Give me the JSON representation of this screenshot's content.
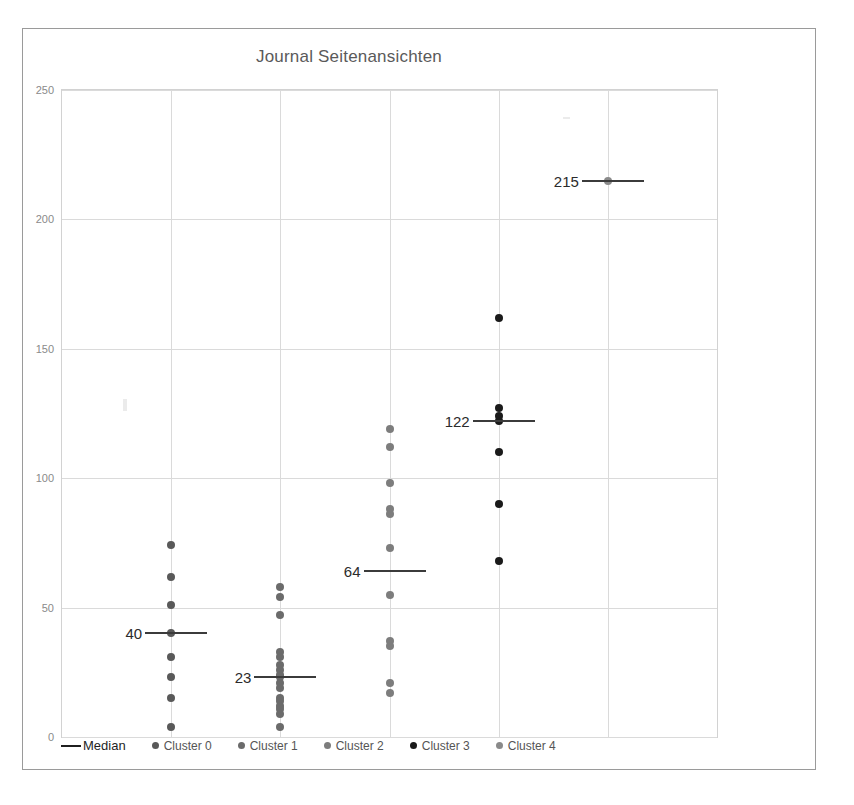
{
  "chart_data": {
    "type": "scatter",
    "title": "Journal Seitenansichten",
    "xlabel": "",
    "ylabel": "",
    "ylim": [
      0,
      250
    ],
    "yticks": [
      0,
      50,
      100,
      150,
      200,
      250
    ],
    "grid": true,
    "legend_position": "bottom",
    "legend": [
      {
        "label": "Median",
        "marker": "line",
        "color": "#1f1f1f"
      },
      {
        "label": "Cluster 0",
        "marker": "dot",
        "color": "#595959"
      },
      {
        "label": "Cluster 1",
        "marker": "dot",
        "color": "#6b6b6b"
      },
      {
        "label": "Cluster 2",
        "marker": "dot",
        "color": "#7d7d7d"
      },
      {
        "label": "Cluster 3",
        "marker": "dot",
        "color": "#1a1a1a"
      },
      {
        "label": "Cluster 4",
        "marker": "dot",
        "color": "#8a8a8a"
      }
    ],
    "series": [
      {
        "name": "Cluster 0",
        "color": "#595959",
        "x_slot": 1,
        "median": 40,
        "median_label": "40",
        "values": [
          74,
          62,
          51,
          40,
          31,
          23,
          15,
          4
        ]
      },
      {
        "name": "Cluster 1",
        "color": "#6b6b6b",
        "x_slot": 2,
        "median": 23,
        "median_label": "23",
        "values": [
          58,
          54,
          47,
          33,
          31,
          28,
          26,
          24,
          23,
          21,
          19,
          15,
          14,
          12,
          11,
          9,
          4
        ]
      },
      {
        "name": "Cluster 2",
        "color": "#7d7d7d",
        "x_slot": 3,
        "median": 64,
        "median_label": "64",
        "values": [
          119,
          112,
          98,
          88,
          86,
          73,
          55,
          37,
          35,
          21,
          17
        ]
      },
      {
        "name": "Cluster 3",
        "color": "#1a1a1a",
        "x_slot": 4,
        "median": 122,
        "median_label": "122",
        "values": [
          162,
          127,
          124,
          122,
          110,
          90,
          68
        ]
      },
      {
        "name": "Cluster 4",
        "color": "#8a8a8a",
        "x_slot": 5,
        "median": 215,
        "median_label": "215",
        "values": [
          215
        ]
      }
    ]
  }
}
